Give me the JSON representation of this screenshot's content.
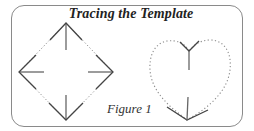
{
  "figure": {
    "title": "Tracing the Template",
    "caption": "Figure 1",
    "colors": {
      "border": "#8a8a8a",
      "solid_line": "#555555",
      "dotted_line": "#8a8a8a",
      "text": "#222222"
    },
    "shapes": [
      {
        "name": "diamond",
        "outline": "dotted",
        "apexes": {
          "top": [
            66,
            23
          ],
          "left": [
            19,
            72
          ],
          "right": [
            113,
            72
          ],
          "bottom": [
            66,
            120
          ]
        },
        "arrows": [
          "up",
          "left",
          "right",
          "down"
        ]
      },
      {
        "name": "heart",
        "outline": "dotted",
        "top_dip": [
          189,
          51
        ],
        "bottom_point": [
          187,
          120
        ]
      }
    ]
  }
}
